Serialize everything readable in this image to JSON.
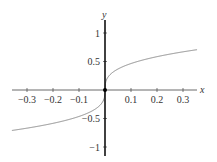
{
  "chart_data": {
    "type": "line",
    "title": "",
    "xlabel": "x",
    "ylabel": "y",
    "function": "y = cbrt(x)",
    "xlim": [
      -0.354,
      0.354
    ],
    "ylim": [
      -1.15,
      1.25
    ],
    "x_ticks": [
      -0.3,
      -0.2,
      -0.1,
      0.1,
      0.2,
      0.3
    ],
    "x_tick_labels": [
      "−0.3",
      "−0.2",
      "−0.1",
      "0.1",
      "0.2",
      "0.3"
    ],
    "y_ticks": [
      1,
      0.5,
      -0.5,
      -1
    ],
    "y_tick_labels": [
      "1",
      "0.5",
      "−0.5",
      "−1"
    ],
    "grid": false,
    "legend": null,
    "series": [
      {
        "name": "cube root",
        "x": [
          -0.35,
          -0.3,
          -0.2,
          -0.1,
          -0.05,
          -0.01,
          0,
          0.01,
          0.05,
          0.1,
          0.2,
          0.3,
          0.35
        ],
        "values": [
          -0.705,
          -0.669,
          -0.585,
          -0.464,
          -0.368,
          -0.215,
          0,
          0.215,
          0.368,
          0.464,
          0.585,
          0.669,
          0.705
        ],
        "color": "#888888"
      }
    ],
    "annotations": [
      {
        "type": "point",
        "x": 0,
        "y": 0
      }
    ]
  },
  "colors": {
    "axis": "#333333",
    "y_axis": "#111111",
    "curve": "#888888"
  }
}
